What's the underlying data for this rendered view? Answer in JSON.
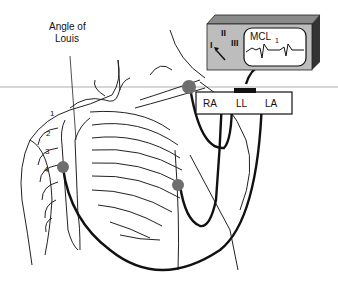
{
  "figure": {
    "annotation_label_line1": "Angle of",
    "annotation_label_line2": "Louis",
    "monitor": {
      "lead_labels": [
        "I",
        "II",
        "III"
      ],
      "screen_label": "MCL",
      "screen_label_subscript": "1"
    },
    "lead_box": {
      "labels": [
        "RA",
        "LL",
        "LA"
      ]
    },
    "rib_numbers": [
      "1",
      "2",
      "3",
      "4"
    ],
    "colors": {
      "electrode": "#6e6e6e",
      "wire": "#111111",
      "monitor_front": "#bdbdbd",
      "monitor_top": "#8a8a8a",
      "monitor_side": "#333333"
    }
  }
}
